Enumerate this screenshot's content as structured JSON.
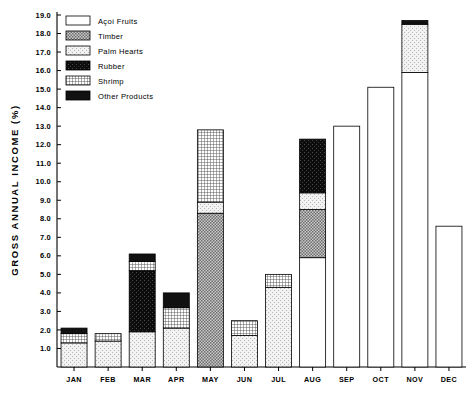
{
  "chart_data": {
    "type": "bar",
    "subtype": "stacked-bar",
    "title": "",
    "xlabel": "",
    "ylabel": "GROSS  ANNUAL  INCOME  (%)",
    "ylim": [
      0,
      19.0
    ],
    "ytick_step": 1.0,
    "yticks": [
      "1.0",
      "2.0",
      "3.0",
      "4.0",
      "5.0",
      "6.0",
      "7.0",
      "8.0",
      "9.0",
      "10.0",
      "11.0",
      "12.0",
      "13.0",
      "14.0",
      "15.0",
      "16.0",
      "17.0",
      "18.0",
      "19.0"
    ],
    "grid": false,
    "legend_position": "top-left-inside",
    "categories": [
      "JAN",
      "FEB",
      "MAR",
      "APR",
      "MAY",
      "JUN",
      "JUL",
      "AUG",
      "SEP",
      "OCT",
      "NOV",
      "DEC"
    ],
    "series": [
      {
        "name": "Açoí Fruits",
        "pattern": "white",
        "values": [
          0.0,
          0.0,
          0.0,
          0.0,
          0.0,
          0.0,
          0.0,
          5.9,
          13.0,
          15.1,
          15.9,
          7.6
        ]
      },
      {
        "name": "Timber",
        "pattern": "dark-stipple",
        "values": [
          0.0,
          0.0,
          0.0,
          0.0,
          8.3,
          0.0,
          0.0,
          2.6,
          0.0,
          0.0,
          0.0,
          0.0
        ]
      },
      {
        "name": "Palm Hearts",
        "pattern": "light-stipple",
        "values": [
          1.3,
          1.4,
          1.9,
          2.1,
          0.6,
          1.7,
          4.3,
          0.9,
          0.0,
          0.0,
          2.6,
          0.0
        ]
      },
      {
        "name": "Rubber",
        "pattern": "black-noise",
        "values": [
          0.0,
          0.0,
          3.3,
          0.0,
          0.0,
          0.0,
          0.0,
          2.9,
          0.0,
          0.0,
          0.0,
          0.0
        ]
      },
      {
        "name": "Shrimp",
        "pattern": "grid",
        "values": [
          0.5,
          0.4,
          0.5,
          1.1,
          3.9,
          0.8,
          0.7,
          0.0,
          0.0,
          0.0,
          0.0,
          0.0
        ]
      },
      {
        "name": "Other Products",
        "pattern": "solid-black",
        "values": [
          0.3,
          0.0,
          0.4,
          0.8,
          0.0,
          0.0,
          0.0,
          0.0,
          0.0,
          0.0,
          0.2,
          0.0
        ]
      }
    ],
    "totals": [
      2.1,
      1.8,
      6.1,
      4.0,
      12.8,
      2.5,
      5.0,
      12.3,
      13.0,
      15.1,
      18.7,
      7.6
    ]
  },
  "legend": {
    "items": [
      {
        "label": "Açoí Fruits"
      },
      {
        "label": "Timber"
      },
      {
        "label": "Palm Hearts"
      },
      {
        "label": "Rubber"
      },
      {
        "label": "Shrimp"
      },
      {
        "label": "Other Products"
      }
    ]
  },
  "axis": {
    "y_title": "GROSS  ANNUAL  INCOME  (%)"
  }
}
